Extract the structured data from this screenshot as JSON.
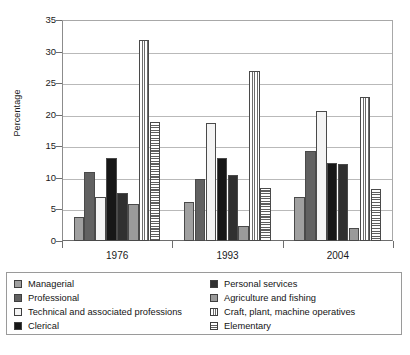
{
  "chart_data": {
    "type": "bar",
    "title": "",
    "subtitle": "",
    "xlabel": "",
    "ylabel": "Percentage",
    "ylim": [
      0,
      35
    ],
    "ytick_labels": [
      "35",
      "30",
      "25",
      "20",
      "15",
      "10",
      "5",
      "0"
    ],
    "yticks": [
      35,
      30,
      25,
      20,
      15,
      10,
      5,
      0
    ],
    "grid": true,
    "legend_position": "bottom",
    "categories": [
      "1976",
      "1993",
      "2004"
    ],
    "series": [
      {
        "name": "Managerial",
        "values": [
          3.8,
          6.1,
          6.9
        ],
        "swatch": "solid-light-gray",
        "color": "#a0a0a0"
      },
      {
        "name": "Professional",
        "values": [
          11.0,
          9.9,
          14.2
        ],
        "swatch": "solid-dark-gray",
        "color": "#616161"
      },
      {
        "name": "Technical and associated professions",
        "values": [
          7.0,
          18.7,
          20.6
        ],
        "swatch": "solid-white",
        "color": "#f4f4f4"
      },
      {
        "name": "Clerical",
        "values": [
          13.1,
          13.2,
          12.3
        ],
        "swatch": "solid-black",
        "color": "#171717"
      },
      {
        "name": "Personal services",
        "values": [
          7.6,
          10.4,
          12.2
        ],
        "swatch": "solid-near-black",
        "color": "#303030"
      },
      {
        "name": "Agriculture and fishing",
        "values": [
          5.8,
          2.3,
          2.1
        ],
        "swatch": "solid-gray",
        "color": "#9a9a9a"
      },
      {
        "name": "Craft, plant, machine operatives",
        "values": [
          31.8,
          26.9,
          22.8
        ],
        "swatch": "vertical-stripes",
        "color": "#6b6b6b"
      },
      {
        "name": "Elementary",
        "values": [
          18.9,
          8.4,
          8.2
        ],
        "swatch": "horizontal-stripes",
        "color": "#5f5f5f"
      }
    ]
  },
  "legend": {
    "left_column": [
      {
        "label": "Managerial",
        "swatch": "managerial"
      },
      {
        "label": "Professional",
        "swatch": "professional"
      },
      {
        "label": "Technical and associated professions",
        "swatch": "technical"
      },
      {
        "label": "Clerical",
        "swatch": "clerical"
      }
    ],
    "right_column": [
      {
        "label": "Personal services",
        "swatch": "personal"
      },
      {
        "label": "Agriculture and fishing",
        "swatch": "agriculture"
      },
      {
        "label": "Craft, plant, machine operatives",
        "swatch": "craft"
      },
      {
        "label": "Elementary",
        "swatch": "elementary"
      }
    ]
  }
}
